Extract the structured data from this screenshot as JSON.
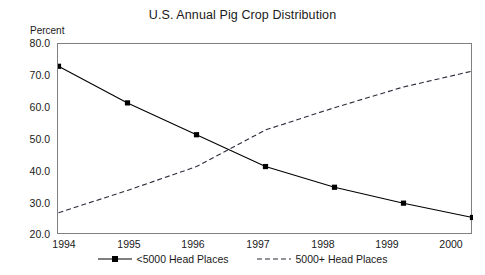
{
  "chart_data": {
    "type": "line",
    "title": "U.S. Annual Pig Crop Distribution",
    "xlabel": "",
    "ylabel": "Percent",
    "categories": [
      "1994",
      "1995",
      "1996",
      "1997",
      "1998",
      "1999",
      "2000"
    ],
    "x": [
      1994,
      1995,
      1996,
      1997,
      1998,
      1999,
      2000
    ],
    "xlim": [
      1994,
      2000
    ],
    "ylim": [
      20.0,
      80.0
    ],
    "yticks": [
      "80.0",
      "70.0",
      "60.0",
      "50.0",
      "40.0",
      "30.0",
      "20.0"
    ],
    "ytick_values": [
      80.0,
      70.0,
      60.0,
      50.0,
      40.0,
      30.0,
      20.0
    ],
    "grid": false,
    "legend_position": "bottom",
    "series": [
      {
        "name": "<5000 Head Places",
        "values": [
          73.0,
          61.5,
          51.5,
          41.5,
          35.0,
          30.0,
          25.5
        ],
        "style": "solid",
        "marker": "square",
        "color": "#000000"
      },
      {
        "name": "5000+ Head Places",
        "values": [
          27.0,
          34.0,
          41.5,
          53.0,
          60.0,
          66.5,
          71.5
        ],
        "style": "dashed",
        "marker": "none",
        "color": "#2b2b3a"
      }
    ]
  },
  "legend": {
    "entries": [
      {
        "label": "<5000 Head Places"
      },
      {
        "label": "5000+ Head Places"
      }
    ]
  },
  "colors": {
    "axis": "#808080",
    "series_solid": "#000000",
    "series_dashed": "#2b2b3a",
    "text": "#1a1a1a",
    "background": "#ffffff"
  }
}
